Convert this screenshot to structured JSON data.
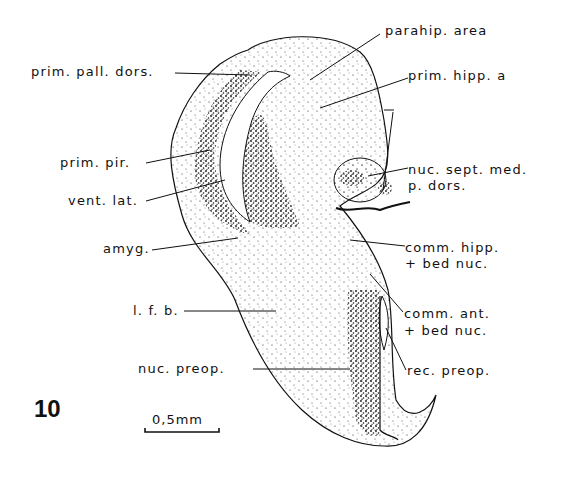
{
  "figure": {
    "number": "10",
    "scale_bar": "0,5mm"
  },
  "labels": {
    "parahip_area": "parahip.  area",
    "prim_pall_dors": "prim.  pall.  dors.",
    "prim_hipp_a": "prim.   hipp.  a",
    "prim_pir": "prim.   pir.",
    "vent_lat": "vent.  lat.",
    "nuc_sept_med_1": "nuc.  sept.  med.",
    "nuc_sept_med_2": "p.  dors.",
    "amyg": "amyg.",
    "comm_hipp_1": "comm.   hipp.",
    "comm_hipp_2": "+ bed   nuc.",
    "l_f_b": "l. f.  b.",
    "comm_ant_1": "comm.    ant.",
    "comm_ant_2": "+ bed    nuc.",
    "nuc_preop": "nuc.    preop.",
    "rec_preop": "rec.   preop."
  },
  "colors": {
    "ink": "#111111",
    "background": "#ffffff"
  }
}
